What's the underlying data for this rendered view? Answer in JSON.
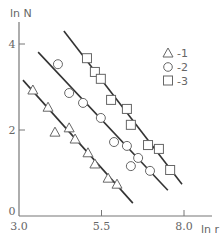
{
  "chart_data": {
    "type": "scatter",
    "title": "",
    "xlabel": "ln r",
    "ylabel": "ln N",
    "xlim": [
      3.0,
      8.5
    ],
    "ylim": [
      0,
      4.6
    ],
    "x_ticks": [
      3.0,
      5.5,
      8.0
    ],
    "x_tick_labels": [
      "3.0",
      "5.5",
      "8.0"
    ],
    "y_ticks": [
      0,
      2,
      4
    ],
    "y_tick_labels": [
      "0",
      "2",
      "4"
    ],
    "grid": false,
    "legend_position": "upper right",
    "series": [
      {
        "name": "1",
        "label": "-1",
        "marker": "triangle",
        "points": [
          [
            3.42,
            2.93
          ],
          [
            3.88,
            2.53
          ],
          [
            4.09,
            1.95
          ],
          [
            4.52,
            2.05
          ],
          [
            4.7,
            1.79
          ],
          [
            5.09,
            1.47
          ],
          [
            5.3,
            1.21
          ],
          [
            5.7,
            0.88
          ],
          [
            5.97,
            0.74
          ]
        ],
        "fit_line": [
          [
            3.12,
            3.16
          ],
          [
            6.45,
            0.3
          ]
        ]
      },
      {
        "name": "2",
        "label": "-2",
        "marker": "circle",
        "points": [
          [
            4.18,
            3.53
          ],
          [
            4.52,
            2.86
          ],
          [
            4.94,
            2.63
          ],
          [
            5.48,
            2.28
          ],
          [
            5.88,
            1.72
          ],
          [
            6.27,
            1.63
          ],
          [
            6.39,
            1.16
          ],
          [
            6.61,
            1.35
          ],
          [
            6.97,
            1.05
          ]
        ],
        "fit_line": [
          [
            3.58,
            3.81
          ],
          [
            7.51,
            0.6
          ]
        ]
      },
      {
        "name": "3",
        "label": "-3",
        "marker": "square",
        "points": [
          [
            5.06,
            3.67
          ],
          [
            5.3,
            3.35
          ],
          [
            5.48,
            3.19
          ],
          [
            5.79,
            2.7
          ],
          [
            6.27,
            2.49
          ],
          [
            6.39,
            2.12
          ],
          [
            6.91,
            1.65
          ],
          [
            7.24,
            1.56
          ],
          [
            7.58,
            1.07
          ]
        ],
        "fit_line": [
          [
            4.36,
            4.3
          ],
          [
            7.94,
            0.74
          ]
        ]
      }
    ]
  },
  "axes": {
    "xlabel": "ln r",
    "ylabel": "ln N",
    "x_tick_labels": [
      "3.0",
      "5.5",
      "8.0"
    ],
    "y_tick_labels": [
      "0",
      "2",
      "4"
    ]
  },
  "legend": {
    "items": [
      {
        "marker": "triangle-icon",
        "label": "-1"
      },
      {
        "marker": "circle-icon",
        "label": "-2"
      },
      {
        "marker": "square-icon",
        "label": "-3"
      }
    ]
  },
  "colors": {
    "axis": "#777777",
    "line": "#333333",
    "marker": "#666666"
  }
}
